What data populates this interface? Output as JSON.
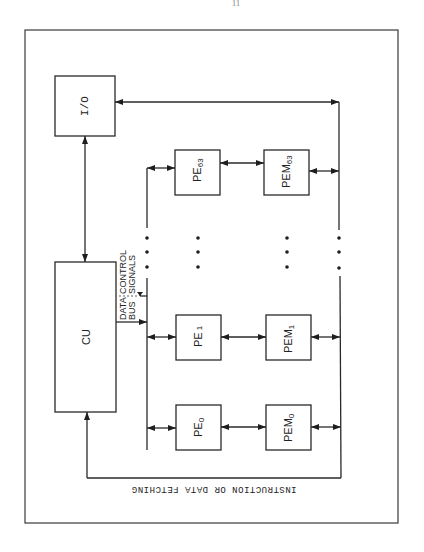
{
  "page": {
    "page_number": "11"
  },
  "diagram": {
    "blocks": {
      "io": {
        "label": "I/O"
      },
      "cu": {
        "label": "CU"
      },
      "pe0": {
        "label": "PE",
        "sub": "0"
      },
      "pe1": {
        "label": "PE",
        "sub": "1"
      },
      "pe63": {
        "label": "PE",
        "sub": "63"
      },
      "pem0": {
        "label": "PEM",
        "sub": "0"
      },
      "pem1": {
        "label": "PEM",
        "sub": "1"
      },
      "pem63": {
        "label": "PEM",
        "sub": "63"
      }
    },
    "bus_labels": {
      "data_line1": "DATA",
      "data_line2": "BUS",
      "control_line1": "CONTROL",
      "control_line2": "SIGNALS"
    },
    "fetch_label": "INSTRUCTION OR DATA FETCHING",
    "connections": [
      {
        "from": "CU",
        "to": "I/O",
        "type": "bidirectional"
      },
      {
        "from": "CU",
        "to": "PE bus",
        "type": "data bus / control signals"
      },
      {
        "from": "PE bus",
        "to": "PE0..PE63",
        "type": "bidirectional"
      },
      {
        "from": "PE_i",
        "to": "PEM_i",
        "type": "bidirectional"
      },
      {
        "from": "PEM0..PEM63",
        "to": "memory bus",
        "type": "bidirectional"
      },
      {
        "from": "memory bus",
        "to": "I/O",
        "type": "bidirectional"
      },
      {
        "from": "memory bus",
        "to": "CU",
        "type": "instruction or data fetching"
      }
    ]
  }
}
